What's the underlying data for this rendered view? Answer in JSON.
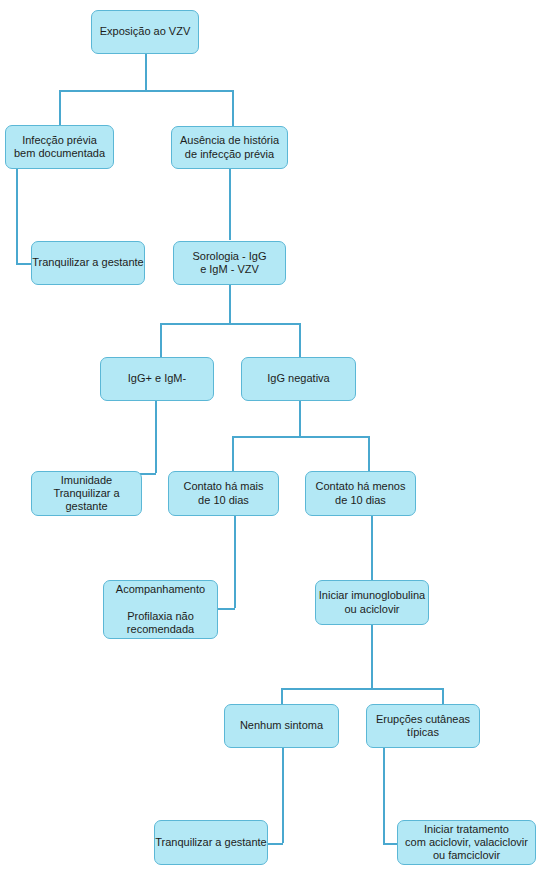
{
  "nodes": {
    "exposure": "Exposição ao VZV",
    "prior_infection": "Infecção prévia\nbem documentada",
    "no_history": "Ausência de história\nde infecção prévia",
    "reassure_1": "Tranquilizar a gestante",
    "serology": "Sorologia - IgG\ne IgM - VZV",
    "igg_pos": "IgG+ e IgM-",
    "igg_neg": "IgG negativa",
    "immunity": "Imunidade\nTranquilizar a gestante",
    "contact_more": "Contato há mais\nde 10 dias",
    "contact_less": "Contato há menos\nde 10 dias",
    "followup": "Acompanhamento\n\nProfilaxia não\nrecomendada",
    "start_ig": "Iniciar imunoglobulina\nou aciclovir",
    "no_symptom": "Nenhum sintoma",
    "rash": "Erupções cutâneas\ntípicas",
    "reassure_2": "Tranquilizar a gestante",
    "treatment": "Iniciar tratamento\ncom aciclovir, valaciclovir\nou famciclovir"
  },
  "colors": {
    "box_fill": "#b3e8f5",
    "box_border": "#5bb7d6",
    "connector": "#4aa8cf"
  }
}
